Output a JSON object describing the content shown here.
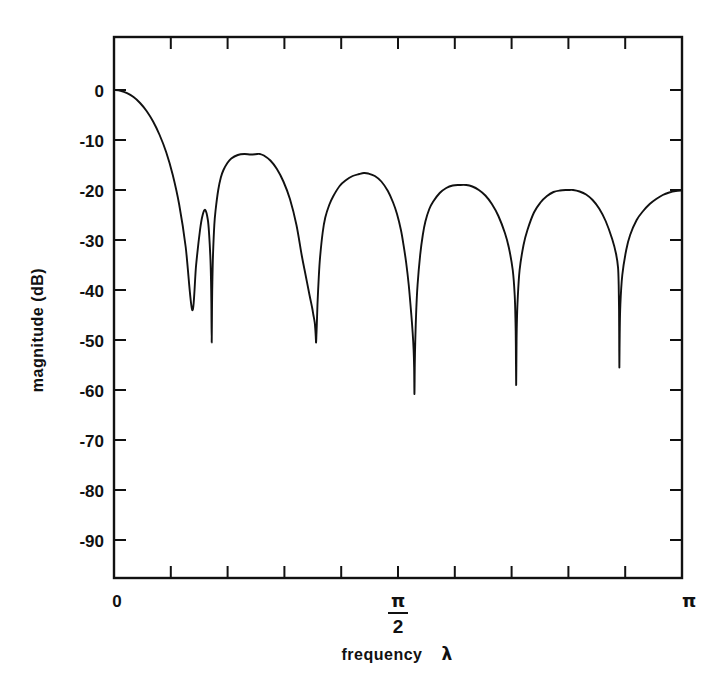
{
  "figure": {
    "title": "",
    "background": "#ffffff",
    "line_color": "#111111"
  },
  "axes": {
    "y_title": "magnitude   (dB)",
    "x_title_frequency": "frequency",
    "x_title_lambda": "λ",
    "x_tick_labels": [
      "0",
      "π/2",
      "π"
    ],
    "x_label_zero": "0",
    "x_label_pi_num": "π",
    "x_label_pi_den": "2",
    "x_label_pi": "π",
    "y_tick_labels": [
      "0",
      "-10",
      "-20",
      "-30",
      "-40",
      "-50",
      "-60",
      "-70",
      "-80",
      "-90"
    ]
  },
  "chart_data": {
    "type": "line",
    "title": "",
    "xlabel": "frequency  λ",
    "ylabel": "magnitude   (dB)",
    "xlim": [
      0,
      3.14159265
    ],
    "ylim": [
      -100,
      2
    ],
    "xticks": [
      0,
      1.5707963,
      3.14159265
    ],
    "xticklabels": [
      "0",
      "π/2",
      "π"
    ],
    "x_minor_tick_count": 9,
    "yticks": [
      0,
      -10,
      -20,
      -30,
      -40,
      -50,
      -60,
      -70,
      -80,
      -90
    ],
    "yticklabels": [
      "0",
      "-10",
      "-20",
      "-30",
      "-40",
      "-50",
      "-60",
      "-70",
      "-80",
      "-90"
    ],
    "grid": false,
    "legend": false,
    "nulls": [
      {
        "lambda": 0.5404,
        "depth_db": -50.5
      },
      {
        "lambda": 1.1177,
        "depth_db": -50.5
      },
      {
        "lambda": 1.6618,
        "depth_db": -60.8
      },
      {
        "lambda": 2.2244,
        "depth_db": -59.0
      },
      {
        "lambda": 2.7943,
        "depth_db": -55.5
      }
    ],
    "sidelobe_peaks": [
      {
        "lambda": 0.8072,
        "level_db": -12.8
      },
      {
        "lambda": 1.3824,
        "level_db": -16.6
      },
      {
        "lambda": 1.9486,
        "level_db": -19.0
      },
      {
        "lambda": 2.5149,
        "level_db": -20.0
      },
      {
        "lambda": 3.14159265,
        "level_db": -20.1
      }
    ],
    "series": [
      {
        "name": "magnitude",
        "x": [
          0.0,
          0.036,
          0.0721,
          0.1081,
          0.1442,
          0.1802,
          0.2163,
          0.2523,
          0.2884,
          0.3244,
          0.3605,
          0.3965,
          0.4326,
          0.4542,
          0.4758,
          0.4903,
          0.5047,
          0.5192,
          0.5264,
          0.5336,
          0.5368,
          0.5386,
          0.5404,
          0.5422,
          0.544,
          0.5476,
          0.5548,
          0.562,
          0.5765,
          0.5909,
          0.6054,
          0.627,
          0.6487,
          0.6847,
          0.7208,
          0.7568,
          0.7929,
          0.8072,
          0.8289,
          0.8649,
          0.901,
          0.937,
          0.9731,
          1.0091,
          1.038,
          1.0596,
          1.0813,
          1.0957,
          1.1029,
          1.1101,
          1.1137,
          1.1159,
          1.1177,
          1.1195,
          1.1217,
          1.1253,
          1.1325,
          1.1397,
          1.1542,
          1.1686,
          1.1903,
          1.2119,
          1.248,
          1.284,
          1.3201,
          1.3561,
          1.3824,
          1.4066,
          1.4427,
          1.4787,
          1.5148,
          1.5437,
          1.5653,
          1.587,
          1.6014,
          1.6158,
          1.6302,
          1.6446,
          1.6518,
          1.6572,
          1.66,
          1.6618,
          1.6636,
          1.6664,
          1.6718,
          1.679,
          1.6934,
          1.7079,
          1.7223,
          1.7439,
          1.7656,
          1.8016,
          1.8377,
          1.8737,
          1.9098,
          1.9486,
          1.9819,
          2.0179,
          2.054,
          2.09,
          2.1261,
          2.1621,
          2.1838,
          2.2054,
          2.2162,
          2.2208,
          2.2226,
          2.2244,
          2.2262,
          2.228,
          2.2326,
          2.2434,
          2.2651,
          2.2867,
          2.3228,
          2.3588,
          2.3949,
          2.4309,
          2.467,
          2.503,
          2.5149,
          2.5391,
          2.5751,
          2.6112,
          2.6472,
          2.6833,
          2.7193,
          2.7554,
          2.777,
          2.7878,
          2.7914,
          2.7934,
          2.7943,
          2.7952,
          2.797,
          2.8006,
          2.8114,
          2.8331,
          2.8547,
          2.8908,
          2.9268,
          2.9629,
          2.9989,
          3.035,
          3.071,
          3.1071,
          3.14159265
        ],
        "y": [
          0.0,
          -0.16,
          -0.62,
          -1.42,
          -2.6,
          -4.2,
          -6.3,
          -9.0,
          -12.4,
          -16.9,
          -22.9,
          -31.4,
          -44.0,
          -35.0,
          -28.0,
          -25.0,
          -24.0,
          -26.0,
          -29.0,
          -34.0,
          -38.5,
          -43.0,
          -50.5,
          -43.0,
          -38.5,
          -33.0,
          -27.0,
          -24.0,
          -20.0,
          -17.5,
          -16.0,
          -14.6,
          -13.7,
          -13.0,
          -12.8,
          -12.9,
          -12.8,
          -12.8,
          -13.1,
          -14.1,
          -15.8,
          -18.3,
          -21.8,
          -27.0,
          -33.0,
          -37.0,
          -41.0,
          -43.5,
          -45.0,
          -46.5,
          -48.0,
          -49.3,
          -50.5,
          -49.0,
          -47.0,
          -43.0,
          -37.5,
          -33.5,
          -28.5,
          -25.5,
          -23.0,
          -21.3,
          -19.2,
          -18.0,
          -17.2,
          -16.8,
          -16.6,
          -16.7,
          -17.2,
          -18.3,
          -20.2,
          -22.5,
          -24.8,
          -28.0,
          -31.0,
          -34.5,
          -39.0,
          -45.0,
          -48.5,
          -52.0,
          -55.5,
          -60.8,
          -55.0,
          -50.0,
          -44.0,
          -39.0,
          -33.0,
          -29.0,
          -26.3,
          -23.8,
          -22.3,
          -20.6,
          -19.6,
          -19.1,
          -19.0,
          -19.0,
          -19.3,
          -20.0,
          -21.1,
          -22.8,
          -25.2,
          -28.6,
          -31.5,
          -36.0,
          -41.0,
          -46.5,
          -51.0,
          -59.0,
          -51.5,
          -47.0,
          -42.0,
          -36.0,
          -31.0,
          -28.0,
          -24.5,
          -22.5,
          -21.2,
          -20.4,
          -20.1,
          -20.0,
          -20.0,
          -20.0,
          -20.3,
          -20.9,
          -22.0,
          -23.7,
          -26.2,
          -29.8,
          -32.8,
          -35.5,
          -39.0,
          -44.0,
          -50.0,
          -55.5,
          -49.0,
          -43.0,
          -37.0,
          -32.0,
          -29.0,
          -26.0,
          -24.2,
          -22.8,
          -21.8,
          -21.0,
          -20.5,
          -20.2,
          -20.1
        ]
      }
    ]
  }
}
